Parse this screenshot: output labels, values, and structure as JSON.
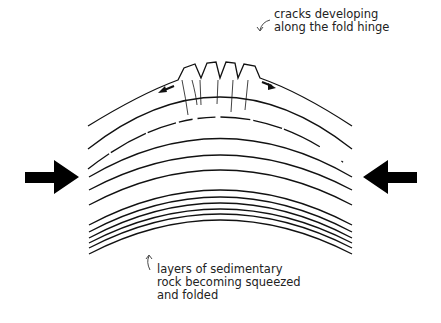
{
  "diagram": {
    "type": "geology-anticline-fold",
    "annotations": {
      "top": [
        "cracks developing",
        "along the fold hinge"
      ],
      "bottom": [
        "layers of sedimentary",
        "rock becoming squeezed",
        "and folded"
      ]
    },
    "compression_arrows": {
      "left": "right-pointing",
      "right": "left-pointing"
    },
    "colors": {
      "ink": "#111111",
      "background": "#ffffff"
    }
  }
}
